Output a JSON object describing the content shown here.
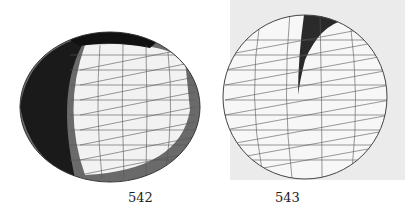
{
  "figures": [
    {
      "label": "542",
      "description": "oblate sphere mesh with dark shaded band and light triangulated front face"
    },
    {
      "label": "543",
      "description": "sphere mesh with dark slit/seam, triangulated wireframe, light gray background"
    }
  ],
  "colors": {
    "dark": "#1a1a1a",
    "mid": "#777777",
    "light": "#f4f4f4",
    "background2": "#ebebeb"
  }
}
